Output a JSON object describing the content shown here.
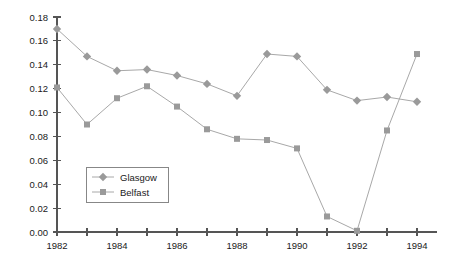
{
  "chart_data": {
    "type": "line",
    "title": "",
    "subtitle": "",
    "xlabel": "",
    "ylabel": "",
    "x": [
      1982,
      1983,
      1984,
      1985,
      1986,
      1987,
      1988,
      1989,
      1990,
      1991,
      1992,
      1993,
      1994
    ],
    "categories": [
      "1982",
      "1983",
      "1984",
      "1985",
      "1986",
      "1987",
      "1988",
      "1989",
      "1990",
      "1991",
      "1992",
      "1993",
      "1994"
    ],
    "series": [
      {
        "name": "Glasgow",
        "marker": "diamond",
        "color": "#9a9a9a",
        "line_color": "#a8a8a8",
        "values": [
          0.17,
          0.147,
          0.135,
          0.136,
          0.131,
          0.124,
          0.114,
          0.149,
          0.147,
          0.119,
          0.11,
          0.113,
          0.109
        ]
      },
      {
        "name": "Belfast",
        "marker": "square",
        "color": "#9a9a9a",
        "line_color": "#a8a8a8",
        "values": [
          0.121,
          0.09,
          0.112,
          0.122,
          0.105,
          0.086,
          0.078,
          0.077,
          0.07,
          0.013,
          0.001,
          0.085,
          0.149
        ]
      }
    ],
    "xlim": [
      1982,
      1994
    ],
    "ylim": [
      0.0,
      0.18
    ],
    "ytick_values": [
      0.0,
      0.02,
      0.04,
      0.06,
      0.08,
      0.1,
      0.12,
      0.14,
      0.16,
      0.18
    ],
    "ytick_labels": [
      "0.00",
      "0.02",
      "0.04",
      "0.06",
      "0.08",
      "0.10",
      "0.12",
      "0.14",
      "0.16",
      "0.18"
    ],
    "xtick_values": [
      1982,
      1983,
      1984,
      1985,
      1986,
      1987,
      1988,
      1989,
      1990,
      1991,
      1992,
      1993,
      1994
    ],
    "xtick_labels_shown": [
      "1982",
      "1984",
      "1986",
      "1988",
      "1990",
      "1992",
      "1994"
    ],
    "grid": false,
    "legend_position": "center-left",
    "legend_entries": [
      "Glasgow",
      "Belfast"
    ]
  },
  "colors": {
    "axis": "#555555",
    "text": "#1a1a1a",
    "marker": "#9a9a9a",
    "line": "#a8a8a8",
    "legend_border": "#7a7a7a",
    "background": "#ffffff"
  }
}
